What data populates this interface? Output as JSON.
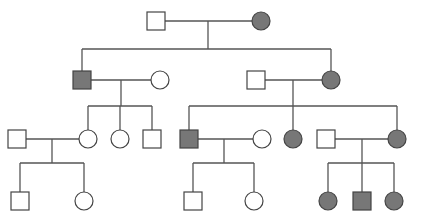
{
  "diagram": {
    "type": "pedigree",
    "colors": {
      "line": "#555555",
      "affected_fill": "#777777",
      "unaffected_fill": "#ffffff",
      "stroke": "#444444"
    },
    "size": 18,
    "individuals": [
      {
        "id": "I-1",
        "sex": "male",
        "affected": false,
        "x": 156,
        "y": 21
      },
      {
        "id": "I-2",
        "sex": "female",
        "affected": true,
        "x": 261,
        "y": 21
      },
      {
        "id": "II-1",
        "sex": "male",
        "affected": true,
        "x": 82,
        "y": 80
      },
      {
        "id": "II-2",
        "sex": "female",
        "affected": false,
        "x": 160,
        "y": 80
      },
      {
        "id": "II-3",
        "sex": "male",
        "affected": false,
        "x": 256,
        "y": 80
      },
      {
        "id": "II-4",
        "sex": "female",
        "affected": true,
        "x": 331,
        "y": 80
      },
      {
        "id": "III-1",
        "sex": "male",
        "affected": false,
        "x": 17,
        "y": 139
      },
      {
        "id": "III-2",
        "sex": "female",
        "affected": false,
        "x": 88,
        "y": 139
      },
      {
        "id": "III-3",
        "sex": "female",
        "affected": false,
        "x": 120,
        "y": 139
      },
      {
        "id": "III-4",
        "sex": "male",
        "affected": false,
        "x": 152,
        "y": 139
      },
      {
        "id": "III-5",
        "sex": "male",
        "affected": true,
        "x": 189,
        "y": 139
      },
      {
        "id": "III-6",
        "sex": "female",
        "affected": false,
        "x": 262,
        "y": 139
      },
      {
        "id": "III-7",
        "sex": "female",
        "affected": true,
        "x": 293,
        "y": 139
      },
      {
        "id": "III-8",
        "sex": "male",
        "affected": false,
        "x": 326,
        "y": 139
      },
      {
        "id": "III-9",
        "sex": "female",
        "affected": true,
        "x": 397,
        "y": 139
      },
      {
        "id": "IV-1",
        "sex": "male",
        "affected": false,
        "x": 20,
        "y": 201
      },
      {
        "id": "IV-2",
        "sex": "female",
        "affected": false,
        "x": 84,
        "y": 201
      },
      {
        "id": "IV-3",
        "sex": "male",
        "affected": false,
        "x": 193,
        "y": 201
      },
      {
        "id": "IV-4",
        "sex": "female",
        "affected": false,
        "x": 254,
        "y": 201
      },
      {
        "id": "IV-5",
        "sex": "female",
        "affected": true,
        "x": 328,
        "y": 201
      },
      {
        "id": "IV-6",
        "sex": "male",
        "affected": true,
        "x": 362,
        "y": 201
      },
      {
        "id": "IV-7",
        "sex": "female",
        "affected": true,
        "x": 394,
        "y": 201
      }
    ],
    "lines": [
      [
        165,
        21,
        252,
        21
      ],
      [
        208,
        21,
        208,
        49
      ],
      [
        82,
        49,
        331,
        49
      ],
      [
        82,
        49,
        82,
        71
      ],
      [
        331,
        49,
        331,
        71
      ],
      [
        91,
        80,
        151,
        80
      ],
      [
        121,
        80,
        121,
        106
      ],
      [
        88,
        106,
        152,
        106
      ],
      [
        88,
        106,
        88,
        130
      ],
      [
        120,
        106,
        120,
        130
      ],
      [
        152,
        106,
        152,
        130
      ],
      [
        265,
        80,
        322,
        80
      ],
      [
        293,
        80,
        293,
        106
      ],
      [
        189,
        106,
        397,
        106
      ],
      [
        189,
        106,
        189,
        130
      ],
      [
        293,
        106,
        293,
        130
      ],
      [
        397,
        106,
        397,
        130
      ],
      [
        26,
        139,
        79,
        139
      ],
      [
        52,
        139,
        52,
        163
      ],
      [
        20,
        163,
        84,
        163
      ],
      [
        20,
        163,
        20,
        192
      ],
      [
        84,
        163,
        84,
        192
      ],
      [
        198,
        139,
        253,
        139
      ],
      [
        224,
        139,
        224,
        163
      ],
      [
        193,
        163,
        254,
        163
      ],
      [
        193,
        163,
        193,
        192
      ],
      [
        254,
        163,
        254,
        192
      ],
      [
        335,
        139,
        388,
        139
      ],
      [
        362,
        139,
        362,
        163
      ],
      [
        328,
        163,
        394,
        163
      ],
      [
        328,
        163,
        328,
        192
      ],
      [
        362,
        163,
        362,
        192
      ],
      [
        394,
        163,
        394,
        192
      ]
    ]
  }
}
